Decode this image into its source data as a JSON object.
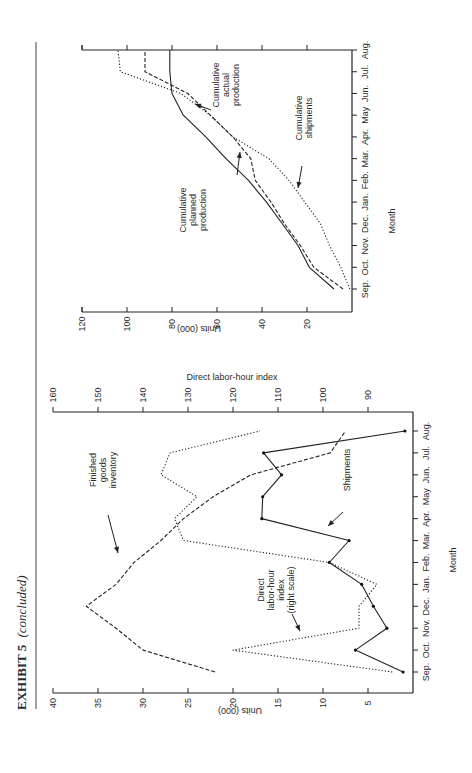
{
  "page": {
    "exhibit_title": "EXHIBIT 5",
    "exhibit_suffix": "(concluded)"
  },
  "chart_data": [
    {
      "type": "line",
      "title": "",
      "xlabel": "Month",
      "ylabel": "Units (000)",
      "x": [
        "Sep.",
        "Oct.",
        "Nov.",
        "Dec.",
        "Jan.",
        "Feb.",
        "Mar.",
        "Apr.",
        "May",
        "Jun.",
        "Jul.",
        "Aug."
      ],
      "ylim": [
        0,
        120
      ],
      "yticks": [
        20,
        40,
        60,
        80,
        100,
        120
      ],
      "grid": false,
      "series": [
        {
          "name": "Cumulative planned production",
          "style": "solid",
          "label_lines": [
            "Cumulative",
            "planned",
            "production"
          ],
          "values": [
            8,
            19,
            24,
            31,
            38,
            46,
            56,
            65,
            75,
            80,
            81,
            81
          ]
        },
        {
          "name": "Cumulative actual production",
          "style": "dashed",
          "label_lines": [
            "Cumulative",
            "actual",
            "production"
          ],
          "values": [
            4,
            17,
            23,
            30,
            36,
            43,
            45,
            53,
            63,
            73,
            92,
            92
          ]
        },
        {
          "name": "Cumulative shipments",
          "style": "dotted",
          "label_lines": [
            "Cumulative",
            "shipments"
          ],
          "values": [
            1,
            5,
            10,
            14,
            21,
            28,
            37,
            53,
            63,
            76,
            103,
            104
          ]
        }
      ]
    },
    {
      "type": "line",
      "title": "",
      "xlabel": "Month",
      "ylabel": "Units (000)",
      "y2label": "Direct labor-hour index",
      "x": [
        "Sep.",
        "Oct.",
        "Nov.",
        "Dec.",
        "Jan.",
        "Feb.",
        "Mar.",
        "Apr.",
        "May",
        "Jun.",
        "Jul.",
        "Aug."
      ],
      "ylim": [
        0,
        40
      ],
      "yticks": [
        5,
        10,
        15,
        20,
        25,
        30,
        35,
        40
      ],
      "y2lim": [
        80,
        160
      ],
      "y2ticks": [
        90,
        100,
        110,
        120,
        130,
        140,
        150,
        160
      ],
      "grid": false,
      "series": [
        {
          "name": "Shipments",
          "style": "solid-markers",
          "axis": "left",
          "label_lines": [
            "Shipments"
          ],
          "values": [
            1.1,
            6.4,
            2.9,
            4.4,
            5.7,
            9.3,
            7.1,
            16.8,
            16.7,
            14.6,
            16.6,
            0.9
          ]
        },
        {
          "name": "Finished goods inventory",
          "style": "dashed",
          "axis": "left",
          "label_lines": [
            "Finished",
            "goods",
            "inventory"
          ],
          "values": [
            22,
            30,
            33,
            36.3,
            33,
            31,
            28,
            25.5,
            22.2,
            18,
            9.2,
            7.5
          ]
        },
        {
          "name": "Direct labor-hour index (right scale)",
          "style": "dotted",
          "axis": "right",
          "label_lines": [
            "Direct",
            "labor-hour",
            "index",
            "(right scale)"
          ],
          "values": [
            84.6,
            120,
            92,
            92,
            88,
            98.6,
            131,
            133,
            128,
            136,
            134,
            114
          ]
        }
      ]
    }
  ]
}
